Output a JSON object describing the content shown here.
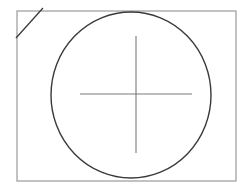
{
  "canvas": {
    "width": 252,
    "height": 186,
    "background": "#ffffff"
  },
  "shapes": {
    "frame": {
      "x": 17,
      "y": 11,
      "width": 219,
      "height": 170,
      "stroke": "#9a9a9a"
    },
    "circle": {
      "cx": 131,
      "cy": 95,
      "rx": 80,
      "ry": 83,
      "stroke": "#3a3a3a"
    },
    "crosshair_h": {
      "x1": 80,
      "y1": 94,
      "x2": 192,
      "y2": 94,
      "stroke": "#7a7a7a"
    },
    "crosshair_v": {
      "x1": 136,
      "y1": 36,
      "x2": 136,
      "y2": 153,
      "stroke": "#7a7a7a"
    },
    "diagonal": {
      "x1": 43,
      "y1": 8,
      "x2": 16,
      "y2": 38,
      "stroke": "#3a3a3a"
    }
  }
}
